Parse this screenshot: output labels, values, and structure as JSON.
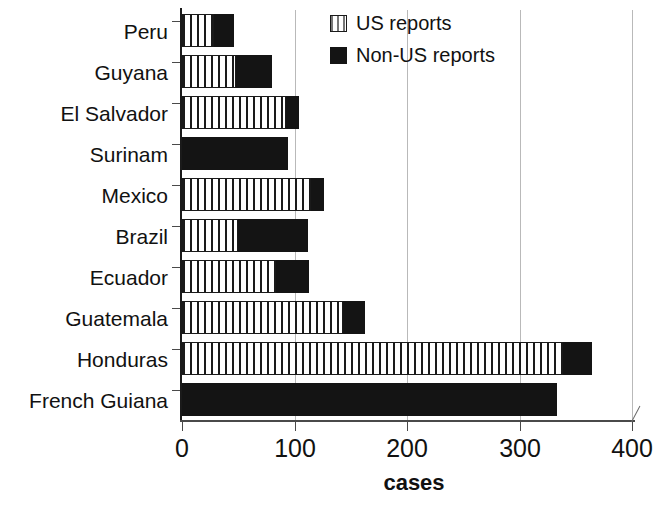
{
  "chart_data": {
    "type": "bar",
    "orientation": "horizontal",
    "stacked": true,
    "title": "",
    "xlabel": "cases",
    "ylabel": "",
    "xlim": [
      0,
      400
    ],
    "xticks": [
      0,
      100,
      200,
      300,
      400
    ],
    "grid": true,
    "legend_position": "top-right",
    "categories": [
      "Peru",
      "Guyana",
      "El Salvador",
      "Surinam",
      "Mexico",
      "Brazil",
      "Ecuador",
      "Guatemala",
      "Honduras",
      "French Guiana"
    ],
    "series": [
      {
        "name": "US reports",
        "values": [
          28,
          48,
          92,
          0,
          114,
          50,
          83,
          143,
          338,
          0
        ]
      },
      {
        "name": "Non-US reports",
        "values": [
          18,
          32,
          12,
          94,
          12,
          62,
          30,
          19,
          26,
          333
        ]
      }
    ],
    "totals": [
      46,
      80,
      104,
      94,
      126,
      112,
      113,
      162,
      364,
      333
    ]
  },
  "legend": {
    "items": [
      {
        "label": "US reports",
        "swatch": "striped-vertical-swatch"
      },
      {
        "label": "Non-US reports",
        "swatch": "solid-black-swatch"
      }
    ]
  },
  "axis": {
    "x_title": "cases",
    "x_tick_labels": [
      "0",
      "100",
      "200",
      "300",
      "400"
    ]
  },
  "colors": {
    "bar_us": "#ffffff",
    "bar_us_stripe": "#1a1a1a",
    "bar_nonus": "#141414",
    "axis": "#4a4a4a",
    "grid": "#b9b9b9",
    "text": "#111111",
    "background": "#ffffff"
  }
}
